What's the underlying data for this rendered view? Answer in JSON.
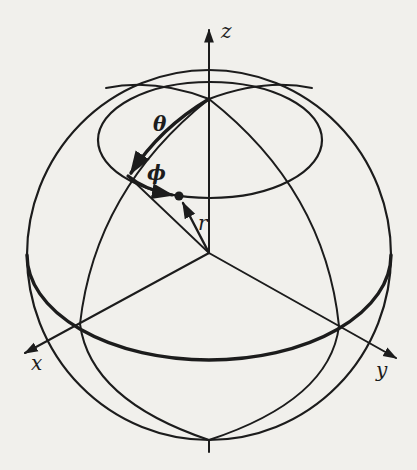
{
  "figure": {
    "ink_color": "#1c1c1c",
    "background": "#f1f0ec"
  },
  "labels": {
    "z_axis": "z",
    "x_axis": "x",
    "y_axis": "y",
    "theta": "θ",
    "phi": "ϕ",
    "r": "r"
  },
  "elements": [
    {
      "id": "sphere-outline",
      "kind": "circle",
      "label": "sphere"
    },
    {
      "id": "equator",
      "kind": "ellipse",
      "label": "equator (thick)"
    },
    {
      "id": "latitude-circle",
      "kind": "ellipse",
      "label": "small circle of constant θ"
    },
    {
      "id": "meridian-x",
      "kind": "arc",
      "label": "meridian in xz-plane"
    },
    {
      "id": "meridian-y",
      "kind": "arc",
      "label": "meridian in yz-plane"
    },
    {
      "id": "theta-arc",
      "kind": "arrow-arc",
      "label": "θ"
    },
    {
      "id": "phi-arc",
      "kind": "arrow-arc",
      "label": "ϕ"
    },
    {
      "id": "r-vector",
      "kind": "arrow",
      "label": "r"
    },
    {
      "id": "point",
      "kind": "dot",
      "label": "point P"
    }
  ]
}
